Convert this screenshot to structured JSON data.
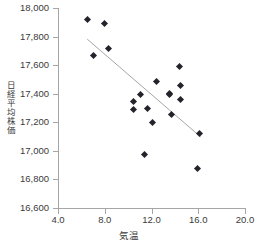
{
  "chart_data": {
    "type": "scatter",
    "title": "",
    "xlabel": "気温",
    "ylabel": "日経平均株価",
    "xlim": [
      4.0,
      20.0
    ],
    "ylim": [
      16600,
      18000
    ],
    "xticks": [
      "4.0",
      "8.0",
      "12.0",
      "16.0",
      "20.0"
    ],
    "xtick_values": [
      4.0,
      8.0,
      12.0,
      16.0,
      20.0
    ],
    "yticks": [
      "18,000",
      "17,800",
      "17,600",
      "17,400",
      "17,200",
      "17,000",
      "16,800",
      "16,600"
    ],
    "ytick_values": [
      18000,
      17800,
      17600,
      17400,
      17200,
      17000,
      16800,
      16600
    ],
    "grid": false,
    "legend": false,
    "marker": "diamond",
    "marker_color": "#23232b",
    "points": [
      {
        "x": 6.5,
        "y": 17920
      },
      {
        "x": 7.0,
        "y": 17665
      },
      {
        "x": 8.0,
        "y": 17890
      },
      {
        "x": 8.3,
        "y": 17720
      },
      {
        "x": 10.5,
        "y": 17345
      },
      {
        "x": 10.5,
        "y": 17288
      },
      {
        "x": 11.1,
        "y": 17392
      },
      {
        "x": 11.4,
        "y": 16978
      },
      {
        "x": 11.7,
        "y": 17300
      },
      {
        "x": 12.1,
        "y": 17200
      },
      {
        "x": 12.4,
        "y": 17488
      },
      {
        "x": 13.5,
        "y": 17405
      },
      {
        "x": 13.5,
        "y": 17392
      },
      {
        "x": 13.7,
        "y": 17252
      },
      {
        "x": 14.4,
        "y": 17588
      },
      {
        "x": 14.5,
        "y": 17458
      },
      {
        "x": 14.5,
        "y": 17358
      },
      {
        "x": 15.9,
        "y": 16880
      },
      {
        "x": 16.1,
        "y": 17125
      }
    ],
    "trendline": {
      "visible": true,
      "color": "#a6a6a6",
      "x_start": 6.5,
      "y_start": 17782,
      "x_end": 16.2,
      "y_end": 17098
    }
  }
}
